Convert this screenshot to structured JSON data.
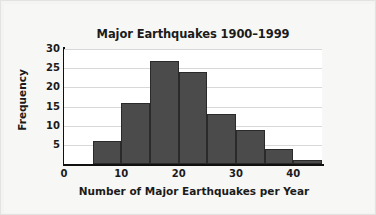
{
  "chart_data": {
    "type": "bar",
    "title": "Major Earthquakes 1900–1999",
    "xlabel": "Number of Major Earthquakes per Year",
    "ylabel": "Frequency",
    "grid": true,
    "legend": null,
    "xlim": [
      0,
      45
    ],
    "ylim": [
      0,
      30
    ],
    "bin_width": 5,
    "bin_edges": [
      5,
      10,
      15,
      20,
      25,
      30,
      35,
      40,
      45
    ],
    "categories": [
      "5–10",
      "10–15",
      "15–20",
      "20–25",
      "25–30",
      "30–35",
      "35–40",
      "40–45"
    ],
    "values": [
      6,
      16,
      27,
      24,
      13,
      9,
      4,
      1
    ],
    "bin_starts": [
      5,
      10,
      15,
      20,
      25,
      30,
      35,
      40
    ],
    "xticks": [
      0,
      10,
      20,
      30,
      40
    ],
    "xtick_labels": [
      "0",
      "10",
      "20",
      "30",
      "40"
    ],
    "yticks": [
      5,
      10,
      15,
      20,
      25,
      30
    ],
    "ytick_labels": [
      "5",
      "10",
      "15",
      "20",
      "25",
      "30"
    ],
    "colors": {
      "bar_fill": "#4b4b4b",
      "bar_edge": "#2a2a2a",
      "plot_background": "#ffffff",
      "page_background": "#f4f4f3",
      "gridline": "#d8d8d8",
      "axis": "#101010",
      "text": "#1b1b1b"
    }
  }
}
